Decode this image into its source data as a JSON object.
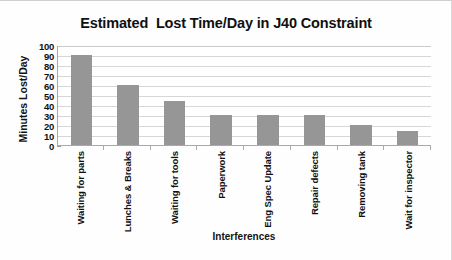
{
  "chart_data": {
    "type": "bar",
    "title": "Estimated  Lost Time/Day in J40 Constraint",
    "xlabel": "Interferences",
    "ylabel": "Minutes Lost/Day",
    "categories": [
      "Waiting for parts",
      "Lunches & Breaks",
      "Waiting for tools",
      "Paperwork",
      "Eng Spec Update",
      "Repair defects",
      "Removing tank",
      "Wait for inspector"
    ],
    "values": [
      90,
      60,
      44,
      30,
      30,
      30,
      20,
      14
    ],
    "ylim": [
      0,
      100
    ],
    "ytick_step": 10,
    "yticks": [
      100,
      90,
      80,
      70,
      60,
      50,
      40,
      30,
      20,
      10,
      0
    ],
    "grid": true,
    "legend": false,
    "series": [
      {
        "name": "Minutes Lost/Day",
        "values": [
          90,
          60,
          44,
          30,
          30,
          30,
          20,
          14
        ]
      }
    ],
    "colors": {
      "bar_fill": "#969696",
      "gridline": "#d7d7d7",
      "axis_line": "#a9a9a9",
      "text": "#111111",
      "plot_background": "#ffffff",
      "chart_background": "#fefefe"
    }
  }
}
